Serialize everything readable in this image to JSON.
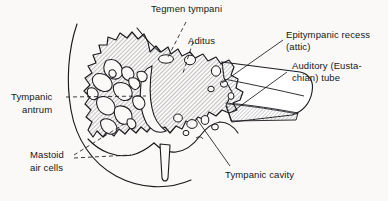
{
  "figure": {
    "background_color": "#faf9f7",
    "ink_color": "#1b1b1f",
    "hatch_color": "#8b8b90",
    "hatch_angle_deg": 45,
    "style": "line drawing with diagonal hatching, hand-lettered labels"
  },
  "labels": {
    "tegmen_tympani": "Tegmen tympani",
    "aditus": "Aditus",
    "epitympanic_recess_line1": "Epitympanic recess",
    "epitympanic_recess_line2": "(attic)",
    "auditory_tube_line1": "Auditory (Eusta-",
    "auditory_tube_line2": "chian) tube",
    "tympanic_antrum_line1": "Tympanic",
    "tympanic_antrum_line2": "antrum",
    "mastoid_air_cells_line1": "Mastoid",
    "mastoid_air_cells_line2": "air cells",
    "tympanic_cavity": "Tympanic cavity"
  },
  "structures": [
    {
      "name": "tegmen-tympani",
      "leader": "dashed",
      "side": "top"
    },
    {
      "name": "aditus",
      "leader": "dashed",
      "side": "top"
    },
    {
      "name": "epitympanic-recess",
      "leader": "solid",
      "side": "right"
    },
    {
      "name": "auditory-tube",
      "leader": "solid",
      "side": "right"
    },
    {
      "name": "tympanic-antrum",
      "leader": "dashed",
      "side": "left"
    },
    {
      "name": "mastoid-air-cells",
      "leader": "dashed",
      "side": "left"
    },
    {
      "name": "tympanic-cavity",
      "leader": "solid",
      "side": "bottom-right"
    }
  ]
}
